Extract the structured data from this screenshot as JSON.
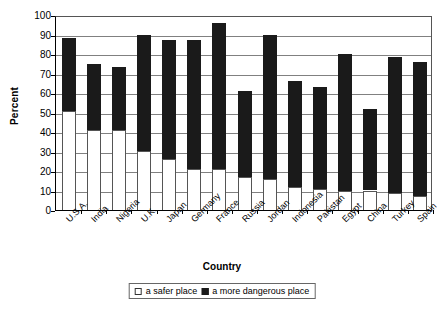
{
  "chart_data": {
    "type": "bar",
    "stacked": true,
    "title": "",
    "xlabel": "Country",
    "ylabel": "Percent",
    "ylim": [
      0,
      100
    ],
    "yticks": [
      0,
      10,
      20,
      30,
      40,
      50,
      60,
      70,
      80,
      90,
      100
    ],
    "grid": true,
    "legend_position": "bottom",
    "categories": [
      "U.S.A.",
      "India",
      "Nigeria",
      "U.K.",
      "Japan",
      "Germany",
      "France",
      "Russia",
      "Jordan",
      "Indonesia",
      "Pakistan",
      "Egypt",
      "China",
      "Turkey",
      "Spain"
    ],
    "series": [
      {
        "name": "a safer place",
        "color": "#ffffff",
        "values": [
          51,
          41,
          41,
          30.5,
          26,
          21,
          21,
          17,
          16,
          12,
          11,
          10,
          10,
          8.5,
          7
        ]
      },
      {
        "name": "a more dangerous place",
        "color": "#1a1a1a",
        "values": [
          88,
          75,
          73.5,
          90,
          87,
          87,
          96,
          61,
          90,
          66,
          63,
          80,
          52,
          78.5,
          76
        ]
      }
    ]
  },
  "legend": {
    "items": [
      {
        "label": "a safer place",
        "swatch": "light"
      },
      {
        "label": "a more dangerous place",
        "swatch": "dark"
      }
    ]
  }
}
